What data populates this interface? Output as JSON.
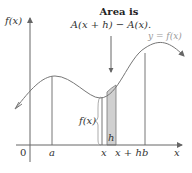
{
  "annotation": {
    "line1": "Area is",
    "line2": "A(x + h) − A(x)."
  },
  "axes": {
    "y_label": "f(x)",
    "x_label": "x",
    "origin_label": "0"
  },
  "ticks": {
    "a": "a",
    "x": "x",
    "x_plus_h": "x + h",
    "b": "b"
  },
  "curve_label": "y = f(x)",
  "strip": {
    "height_label": "f(x)",
    "width_label": "h",
    "fill_color": "#d0d0d0"
  },
  "colors": {
    "axis": "#555555",
    "curve": "#777777",
    "text": "#333333"
  }
}
